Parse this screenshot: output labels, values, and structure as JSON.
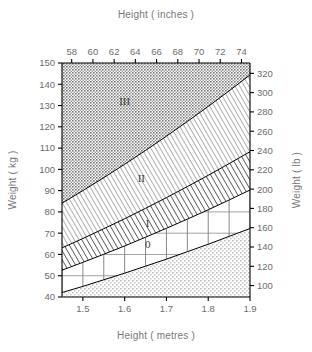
{
  "chart_data": {
    "type": "area",
    "title": "",
    "xlabel": "Height ( metres )",
    "xlabel_top": "Height ( inches )",
    "ylabel": "Weight ( kg )",
    "ylabel_right": "Weight ( lb )",
    "grid": true,
    "legend": "none",
    "xlim": [
      1.45,
      1.9
    ],
    "ylim": [
      40,
      150
    ],
    "xlim_top_inches": [
      57.087,
      74.803
    ],
    "ylim_right_lb": [
      88.18,
      330.69
    ],
    "x_ticks": [
      "1.5",
      "1.6",
      "1.7",
      "1.8",
      "1.9"
    ],
    "x_tick_values": [
      1.5,
      1.6,
      1.7,
      1.8,
      1.9
    ],
    "x_ticks_top": [
      "58",
      "60",
      "62",
      "64",
      "66",
      "68",
      "70",
      "72",
      "74"
    ],
    "x_tick_values_top": [
      58,
      60,
      62,
      64,
      66,
      68,
      70,
      72,
      74
    ],
    "y_ticks": [
      "40",
      "50",
      "60",
      "70",
      "80",
      "90",
      "100",
      "110",
      "120",
      "130",
      "140",
      "150"
    ],
    "y_tick_values": [
      40,
      50,
      60,
      70,
      80,
      90,
      100,
      110,
      120,
      130,
      140,
      150
    ],
    "y_ticks_right": [
      "100",
      "120",
      "140",
      "160",
      "180",
      "200",
      "220",
      "240",
      "260",
      "280",
      "300",
      "320"
    ],
    "y_tick_values_right": [
      100,
      120,
      140,
      160,
      180,
      200,
      220,
      240,
      260,
      280,
      300,
      320
    ],
    "grid_x_step": 0.05,
    "grid_y_step": 10,
    "boundary_curves": [
      {
        "name": "underweight-upper",
        "bmi": 20,
        "label": "lower limit of grade 0",
        "points": [
          [
            1.45,
            42.1
          ],
          [
            1.5,
            45.0
          ],
          [
            1.55,
            48.1
          ],
          [
            1.6,
            51.2
          ],
          [
            1.65,
            54.5
          ],
          [
            1.7,
            57.8
          ],
          [
            1.75,
            61.3
          ],
          [
            1.8,
            64.8
          ],
          [
            1.85,
            68.5
          ],
          [
            1.9,
            72.2
          ]
        ]
      },
      {
        "name": "grade0-upper",
        "bmi": 25,
        "label": "grade 0 / grade I boundary",
        "points": [
          [
            1.45,
            52.6
          ],
          [
            1.5,
            56.3
          ],
          [
            1.55,
            60.1
          ],
          [
            1.6,
            64.0
          ],
          [
            1.65,
            68.1
          ],
          [
            1.7,
            72.3
          ],
          [
            1.75,
            76.6
          ],
          [
            1.8,
            81.0
          ],
          [
            1.85,
            85.6
          ],
          [
            1.9,
            90.3
          ]
        ]
      },
      {
        "name": "gradeI-upper",
        "bmi": 30,
        "label": "grade I / grade II boundary",
        "points": [
          [
            1.45,
            63.1
          ],
          [
            1.5,
            67.5
          ],
          [
            1.55,
            72.1
          ],
          [
            1.6,
            76.8
          ],
          [
            1.65,
            81.7
          ],
          [
            1.7,
            86.7
          ],
          [
            1.75,
            91.9
          ],
          [
            1.8,
            97.2
          ],
          [
            1.85,
            102.7
          ],
          [
            1.9,
            108.3
          ]
        ]
      },
      {
        "name": "gradeII-upper",
        "bmi": 40,
        "label": "grade II / grade III boundary",
        "points": [
          [
            1.45,
            84.1
          ],
          [
            1.5,
            90.0
          ],
          [
            1.55,
            96.1
          ],
          [
            1.6,
            102.4
          ],
          [
            1.65,
            108.9
          ],
          [
            1.7,
            115.6
          ],
          [
            1.75,
            122.5
          ],
          [
            1.8,
            129.6
          ],
          [
            1.85,
            136.9
          ],
          [
            1.9,
            144.4
          ]
        ]
      }
    ],
    "regions": [
      {
        "label": "",
        "name": "underweight",
        "fill": "stipple-light",
        "bmi_range": "< 20"
      },
      {
        "label": "0",
        "name": "grade-0",
        "fill": "white-grid",
        "bmi_range": "20 - 25"
      },
      {
        "label": "I",
        "name": "grade-1",
        "fill": "diagonal-hatch",
        "bmi_range": "25 - 30"
      },
      {
        "label": "II",
        "name": "grade-2",
        "fill": "fine-hatch",
        "bmi_range": "30 - 40"
      },
      {
        "label": "III",
        "name": "grade-3",
        "fill": "stipple-dark",
        "bmi_range": "> 40"
      }
    ]
  },
  "labels": {
    "top_title": "Height ( inches )",
    "bottom_title": "Height ( metres )",
    "left_title": "Weight ( kg )",
    "right_title": "Weight ( lb )",
    "region_0": "0",
    "region_1": "I",
    "region_2": "II",
    "region_3": "III"
  },
  "colors": {
    "background": "#ffffff",
    "axis": "#000000",
    "text": "#6f6f6f",
    "region_label": "#3a3a3a",
    "stipple_light": "#cfcfcf",
    "stipple_dark": "#8f8f8f",
    "hatch": "#5a5a5a",
    "grid": "#8a8a8a"
  }
}
